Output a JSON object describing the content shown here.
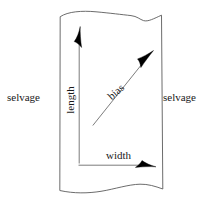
{
  "diagram": {
    "background_color": "#ffffff",
    "line_color": "#2b2b2b",
    "arrow_color": "#000000",
    "text_color": "#1a1a1a",
    "labels": {
      "selvage_left": "selvage",
      "selvage_right": "selvage",
      "length": "length",
      "bias": "bias",
      "width": "width"
    },
    "shape": {
      "name": "fabric-swatch",
      "left_edge_x": 60,
      "right_edge_x": 162,
      "top_edge_y": 16,
      "bottom_edge_y": 190,
      "top_edge_style": "wavy",
      "bottom_edge_style": "wavy",
      "side_edge_style": "straight"
    },
    "arrows": [
      {
        "name": "length-arrow",
        "label": "length",
        "direction": "up",
        "from": [
          79,
          163
        ],
        "to": [
          79,
          28
        ]
      },
      {
        "name": "bias-arrow",
        "label": "bias",
        "direction": "up-right",
        "from": [
          93,
          125
        ],
        "to": [
          152,
          52
        ]
      },
      {
        "name": "width-arrow",
        "label": "width",
        "direction": "right",
        "from": [
          79,
          165
        ],
        "to": [
          155,
          165
        ]
      }
    ]
  }
}
